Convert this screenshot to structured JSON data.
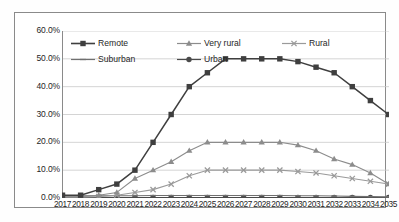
{
  "chart_data": {
    "type": "line",
    "title": "",
    "subtitle": "",
    "xlabel": "",
    "ylabel": "",
    "grid": "horizontal",
    "legend_position": "top-left-inside",
    "ylim": [
      0,
      60
    ],
    "ytick_labels": [
      "60.0%",
      "50.0%",
      "40.0%",
      "30.0%",
      "20.0%",
      "10.0%",
      "0.0%"
    ],
    "ytick_values": [
      60,
      50,
      40,
      30,
      20,
      10,
      0
    ],
    "categories": [
      "2017",
      "2018",
      "2019",
      "2020",
      "2021",
      "2022",
      "2023",
      "2024",
      "2025",
      "2026",
      "2027",
      "2028",
      "2029",
      "2030",
      "2031",
      "2032",
      "2033",
      "2034",
      "2035"
    ],
    "series": [
      {
        "name": "Remote",
        "marker": "square",
        "color": "#3f3f3f",
        "values": [
          1,
          1,
          3,
          5,
          10,
          20,
          30,
          40,
          45,
          50,
          50,
          50,
          50,
          49,
          47,
          45,
          40,
          35,
          30
        ]
      },
      {
        "name": "Very rural",
        "marker": "triangle",
        "color": "#8c8c8c",
        "values": [
          0.5,
          0.5,
          1,
          2,
          7,
          10,
          13,
          17,
          20,
          20,
          20,
          20,
          20,
          19,
          17,
          14,
          12,
          9,
          5
        ]
      },
      {
        "name": "Rural",
        "marker": "cross",
        "color": "#9a9a9a",
        "values": [
          0.3,
          0.3,
          0.5,
          1,
          2,
          3,
          5,
          8,
          10,
          10,
          10,
          10,
          10,
          9.5,
          9,
          8,
          7,
          6,
          5
        ]
      },
      {
        "name": "Suburban",
        "marker": "dash",
        "color": "#707070",
        "values": [
          0.8,
          0.8,
          0.8,
          0.8,
          0.8,
          0.9,
          0.9,
          0.9,
          0.9,
          0.9,
          0.9,
          0.9,
          0.9,
          0.8,
          0.8,
          0.7,
          0.6,
          0.5,
          0.4
        ]
      },
      {
        "name": "Urban",
        "marker": "circle",
        "color": "#4a4a4a",
        "values": [
          0.2,
          0.2,
          0.2,
          0.2,
          0.2,
          0.2,
          0.2,
          0.2,
          0.2,
          0.2,
          0.2,
          0.2,
          0.2,
          0.2,
          0.2,
          0.2,
          0.2,
          0.2,
          0.2
        ]
      }
    ]
  },
  "legend": {
    "items": [
      {
        "label": "Remote"
      },
      {
        "label": "Very rural"
      },
      {
        "label": "Rural"
      },
      {
        "label": "Suburban"
      },
      {
        "label": "Urban"
      }
    ]
  },
  "colors": {
    "plot_border": "#8a8a8a",
    "gridline": "#c9c9c9",
    "axis_text": "#262626",
    "background": "#ffffff"
  }
}
